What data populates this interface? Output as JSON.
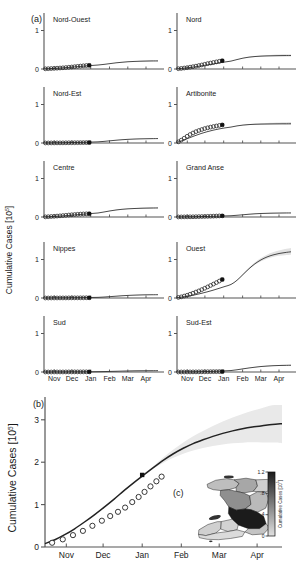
{
  "figure": {
    "panel_a_label": "(a)",
    "panel_b_label": "(b)",
    "panel_c_label": "(c)",
    "yaxis_label_a": "Cumulative Cases [10",
    "yaxis_label_a_sup": "5",
    "yaxis_label_a_close": "]",
    "yaxis_label_b": "Cumulative Cases [10",
    "yaxis_label_b_sup": "5",
    "yaxis_label_b_close": "]",
    "colorbar_label": "Cumulative Cases [10",
    "colorbar_label_sup": "5",
    "colorbar_label_close": "]"
  },
  "chart_data": {
    "type": "line",
    "xlabel": "",
    "ylabel": "Cumulative Cases [10^5]",
    "x_tick_labels": [
      "Nov",
      "Dec",
      "Jan",
      "Feb",
      "Mar",
      "Apr"
    ],
    "x_tick_positions": [
      0.09,
      0.245,
      0.41,
      0.575,
      0.735,
      0.895
    ],
    "x_range_months": [
      "Oct",
      "Apr"
    ],
    "legend": [],
    "grid": false,
    "panel_a": {
      "type": "line",
      "ylim": [
        0,
        1.35
      ],
      "y_tick_labels": [
        "0",
        "1"
      ],
      "y_tick_values": [
        0,
        1
      ],
      "note": "open circles = observed cumulative cases; solid line = model simulation; filled square marks end of calibration data; grey band = uncertainty envelope",
      "subpanels": [
        {
          "name": "Nord-Ouest",
          "plateau": 0.21,
          "data_end_value": 0.095,
          "observed": [
            0.005,
            0.008,
            0.012,
            0.016,
            0.021,
            0.026,
            0.031,
            0.038,
            0.045,
            0.052,
            0.06,
            0.068,
            0.076,
            0.083,
            0.09,
            0.095
          ],
          "curve": [
            0.004,
            0.01,
            0.018,
            0.028,
            0.04,
            0.053,
            0.066,
            0.08,
            0.092,
            0.103,
            0.12,
            0.14,
            0.16,
            0.175,
            0.188,
            0.196,
            0.202,
            0.206,
            0.209,
            0.21
          ],
          "band": 0.018
        },
        {
          "name": "Nord",
          "plateau": 0.35,
          "data_end_value": 0.215,
          "observed": [
            0.008,
            0.015,
            0.025,
            0.035,
            0.048,
            0.06,
            0.074,
            0.09,
            0.105,
            0.122,
            0.14,
            0.155,
            0.17,
            0.185,
            0.2,
            0.215
          ],
          "curve": [
            0.006,
            0.018,
            0.034,
            0.055,
            0.08,
            0.105,
            0.13,
            0.158,
            0.182,
            0.205,
            0.245,
            0.282,
            0.308,
            0.324,
            0.334,
            0.34,
            0.344,
            0.347,
            0.349,
            0.35
          ],
          "band": 0.035
        },
        {
          "name": "Nord-Est",
          "plateau": 0.115,
          "data_end_value": 0.012,
          "observed": [
            0.001,
            0.001,
            0.002,
            0.002,
            0.003,
            0.003,
            0.004,
            0.005,
            0.006,
            0.006,
            0.007,
            0.008,
            0.009,
            0.01,
            0.011,
            0.012
          ],
          "curve": [
            0.001,
            0.002,
            0.004,
            0.006,
            0.009,
            0.012,
            0.016,
            0.02,
            0.025,
            0.03,
            0.042,
            0.057,
            0.072,
            0.085,
            0.095,
            0.102,
            0.107,
            0.11,
            0.113,
            0.115
          ],
          "band": 0.012
        },
        {
          "name": "Artibonite",
          "plateau": 0.5,
          "data_end_value": 0.47,
          "observed": [
            0.03,
            0.075,
            0.125,
            0.175,
            0.22,
            0.26,
            0.295,
            0.325,
            0.35,
            0.375,
            0.395,
            0.412,
            0.428,
            0.442,
            0.456,
            0.47
          ],
          "curve": [
            0.02,
            0.07,
            0.13,
            0.19,
            0.245,
            0.292,
            0.332,
            0.365,
            0.392,
            0.414,
            0.444,
            0.465,
            0.478,
            0.486,
            0.491,
            0.494,
            0.496,
            0.498,
            0.499,
            0.5
          ],
          "band": 0.045
        },
        {
          "name": "Centre",
          "plateau": 0.235,
          "data_end_value": 0.085,
          "observed": [
            0.004,
            0.008,
            0.013,
            0.018,
            0.024,
            0.03,
            0.037,
            0.044,
            0.051,
            0.058,
            0.064,
            0.07,
            0.075,
            0.079,
            0.082,
            0.085
          ],
          "curve": [
            0.003,
            0.009,
            0.017,
            0.027,
            0.039,
            0.052,
            0.065,
            0.079,
            0.092,
            0.104,
            0.13,
            0.158,
            0.182,
            0.2,
            0.212,
            0.22,
            0.226,
            0.23,
            0.233,
            0.235
          ],
          "band": 0.02
        },
        {
          "name": "Grand Anse",
          "plateau": 0.105,
          "data_end_value": 0.03,
          "observed": [
            0.001,
            0.002,
            0.003,
            0.004,
            0.005,
            0.006,
            0.008,
            0.01,
            0.012,
            0.014,
            0.017,
            0.019,
            0.022,
            0.025,
            0.028,
            0.03
          ],
          "curve": [
            0.001,
            0.002,
            0.004,
            0.007,
            0.01,
            0.014,
            0.018,
            0.023,
            0.028,
            0.033,
            0.045,
            0.058,
            0.072,
            0.083,
            0.091,
            0.096,
            0.1,
            0.102,
            0.104,
            0.105
          ],
          "band": 0.012
        },
        {
          "name": "Nippes",
          "plateau": 0.085,
          "data_end_value": 0.006,
          "observed": [
            0.0,
            0.0,
            0.001,
            0.001,
            0.001,
            0.002,
            0.002,
            0.002,
            0.003,
            0.003,
            0.004,
            0.004,
            0.005,
            0.005,
            0.006,
            0.006
          ],
          "curve": [
            0.0,
            0.001,
            0.002,
            0.003,
            0.004,
            0.006,
            0.008,
            0.011,
            0.014,
            0.017,
            0.025,
            0.035,
            0.047,
            0.058,
            0.067,
            0.074,
            0.079,
            0.082,
            0.084,
            0.085
          ],
          "band": 0.01
        },
        {
          "name": "Ouest",
          "plateau": 1.2,
          "data_end_value": 0.48,
          "observed": [
            0.015,
            0.03,
            0.05,
            0.072,
            0.098,
            0.125,
            0.155,
            0.185,
            0.218,
            0.252,
            0.288,
            0.325,
            0.362,
            0.4,
            0.44,
            0.48
          ],
          "curve": [
            0.01,
            0.028,
            0.052,
            0.082,
            0.118,
            0.158,
            0.202,
            0.25,
            0.3,
            0.352,
            0.46,
            0.61,
            0.76,
            0.89,
            0.99,
            1.065,
            1.118,
            1.155,
            1.18,
            1.2
          ],
          "band": 0.1
        },
        {
          "name": "Sud",
          "plateau": 0.035,
          "data_end_value": 0.004,
          "observed": [
            0.0,
            0.0,
            0.0,
            0.001,
            0.001,
            0.001,
            0.001,
            0.002,
            0.002,
            0.002,
            0.003,
            0.003,
            0.003,
            0.004,
            0.004,
            0.004
          ],
          "curve": [
            0.0,
            0.0,
            0.001,
            0.001,
            0.002,
            0.003,
            0.004,
            0.005,
            0.006,
            0.008,
            0.011,
            0.015,
            0.019,
            0.023,
            0.027,
            0.03,
            0.032,
            0.033,
            0.034,
            0.035
          ],
          "band": 0.006
        },
        {
          "name": "Sud-Est",
          "plateau": 0.175,
          "data_end_value": 0.01,
          "observed": [
            0.0,
            0.001,
            0.001,
            0.002,
            0.002,
            0.003,
            0.003,
            0.004,
            0.005,
            0.006,
            0.007,
            0.008,
            0.009,
            0.009,
            0.01,
            0.01
          ],
          "curve": [
            0.0,
            0.001,
            0.003,
            0.005,
            0.008,
            0.012,
            0.017,
            0.023,
            0.03,
            0.038,
            0.058,
            0.082,
            0.105,
            0.125,
            0.142,
            0.154,
            0.163,
            0.169,
            0.172,
            0.175
          ],
          "band": 0.018
        }
      ]
    },
    "panel_b": {
      "type": "line",
      "ylim": [
        0,
        3.35
      ],
      "y_tick_labels": [
        "0",
        "1",
        "2",
        "3"
      ],
      "y_tick_values": [
        0,
        1,
        2,
        3
      ],
      "name": "Haiti national total",
      "observed": [
        0.1,
        0.18,
        0.28,
        0.38,
        0.5,
        0.62,
        0.73,
        0.83,
        0.93,
        1.06,
        1.18,
        1.3,
        1.43,
        1.55,
        1.66
      ],
      "observed_x": [
        0.03,
        0.075,
        0.118,
        0.16,
        0.2,
        0.24,
        0.275,
        0.308,
        0.338,
        0.368,
        0.395,
        0.42,
        0.445,
        0.47,
        0.492
      ],
      "curve": [
        0.08,
        0.17,
        0.29,
        0.43,
        0.59,
        0.76,
        0.94,
        1.13,
        1.33,
        1.52,
        1.7,
        1.88,
        2.05,
        2.2,
        2.33,
        2.44,
        2.53,
        2.61,
        2.68,
        2.74,
        2.79,
        2.83,
        2.86,
        2.89,
        2.91
      ],
      "data_end_value": 1.7,
      "band_upper_max": 3.3,
      "band_lower_max": 2.45
    },
    "panel_c": {
      "type": "heatmap",
      "name": "Haiti department map of cumulative cases",
      "colorbar_ticks": [
        "1.2",
        ".8",
        ".4",
        "0"
      ],
      "colorbar_tick_values": [
        1.2,
        0.8,
        0.4,
        0.0
      ],
      "colorbar_range": [
        0,
        1.2
      ],
      "colorbar_label": "Cumulative Cases [10^5]",
      "regions": [
        {
          "name": "Ouest",
          "value": 1.2
        },
        {
          "name": "Artibonite",
          "value": 0.5
        },
        {
          "name": "Nord",
          "value": 0.35
        },
        {
          "name": "Centre",
          "value": 0.235
        },
        {
          "name": "Nord-Ouest",
          "value": 0.21
        },
        {
          "name": "Sud-Est",
          "value": 0.175
        },
        {
          "name": "Nord-Est",
          "value": 0.115
        },
        {
          "name": "Grand Anse",
          "value": 0.105
        },
        {
          "name": "Nippes",
          "value": 0.085
        },
        {
          "name": "Sud",
          "value": 0.035
        }
      ]
    }
  }
}
